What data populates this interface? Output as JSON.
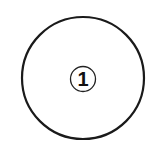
{
  "diagram": {
    "outer_circle": {
      "cx": 83,
      "cy": 78,
      "r": 61,
      "stroke": "#1a1a1a",
      "stroke_width": 2.2
    },
    "badge": {
      "cx": 83,
      "cy": 79,
      "r": 12.5,
      "stroke": "#222222",
      "stroke_width": 1.3,
      "label": "1"
    }
  }
}
